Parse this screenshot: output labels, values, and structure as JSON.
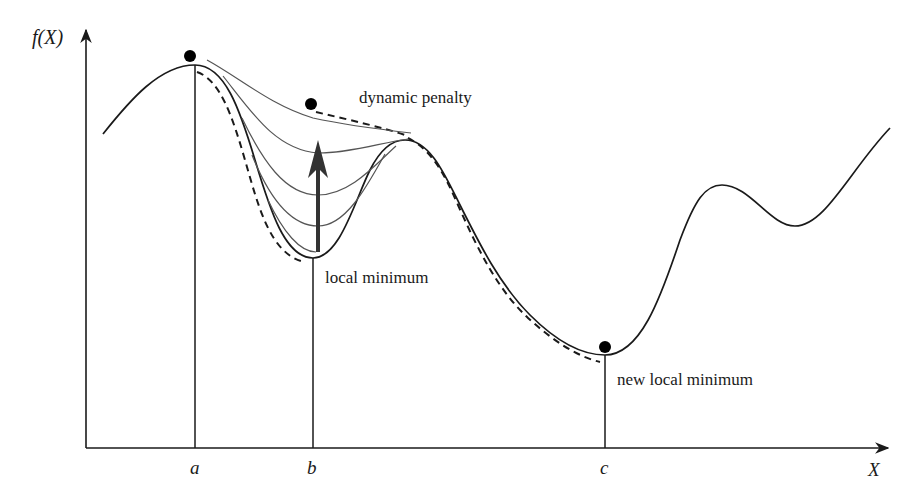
{
  "figure": {
    "axes": {
      "y_label": "f(X)",
      "x_label": "X",
      "ticks": [
        {
          "label": "a",
          "x": 195
        },
        {
          "label": "b",
          "x": 313
        },
        {
          "label": "c",
          "x": 605
        }
      ]
    },
    "annotations": {
      "dynamic_penalty": "dynamic penalty",
      "local_minimum": "local minimum",
      "new_local_minimum": "new local minimum"
    },
    "colors": {
      "main_curve": "#1a1a1a",
      "penalty_curves": "#555555",
      "dashed_path": "#1a1a1a",
      "arrow": "#333333",
      "dot": "#000000"
    },
    "points": [
      {
        "name": "start-point",
        "x": 190,
        "y": 56
      },
      {
        "name": "penalized-point",
        "x": 311,
        "y": 104
      },
      {
        "name": "new-minimum-point",
        "x": 605,
        "y": 347
      }
    ]
  }
}
